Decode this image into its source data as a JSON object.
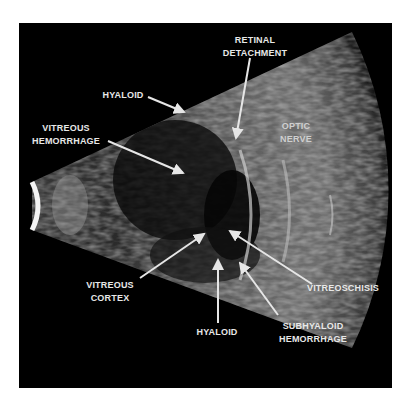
{
  "figure": {
    "type": "ocular B-scan ultrasound",
    "background_color": "#ffffff",
    "frame_color": "#000000",
    "labels": [
      {
        "id": "retinal-detachment",
        "lines": [
          "RETINAL",
          "DETACHMENT"
        ]
      },
      {
        "id": "hyaloid-top",
        "lines": [
          "HYALOID"
        ]
      },
      {
        "id": "vitreous-hemorrhage",
        "lines": [
          "VITREOUS",
          "HEMORRHAGE"
        ]
      },
      {
        "id": "optic-nerve",
        "lines": [
          "OPTIC",
          "NERVE"
        ]
      },
      {
        "id": "vitreous-cortex",
        "lines": [
          "VITREOUS",
          "CORTEX"
        ]
      },
      {
        "id": "hyaloid-bottom",
        "lines": [
          "HYALOID"
        ]
      },
      {
        "id": "vitreoschisis",
        "lines": [
          "VITREOSCHISIS"
        ]
      },
      {
        "id": "subhyaloid-hemorrhage",
        "lines": [
          "SUBHYALOID",
          "HEMORRHAGE"
        ]
      }
    ],
    "arrow_color": "#e6e6e6"
  }
}
